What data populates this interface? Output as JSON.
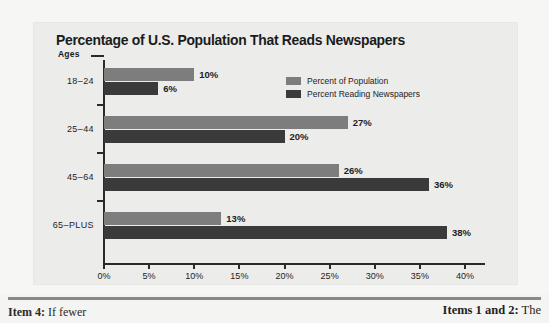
{
  "chart_data": {
    "type": "bar",
    "orientation": "horizontal",
    "title": "Percentage of U.S. Population That Reads Newspapers",
    "xlabel": "",
    "ylabel": "Ages",
    "categories": [
      "18–24",
      "25–44",
      "45–64",
      "65–PLUS"
    ],
    "series": [
      {
        "name": "Percent of Population",
        "color": "#7d7d7d",
        "values": [
          10,
          27,
          26,
          13
        ],
        "labels": [
          "10%",
          "27%",
          "26%",
          "13%"
        ]
      },
      {
        "name": "Percent Reading Newspapers",
        "color": "#3a3a3a",
        "values": [
          6,
          20,
          36,
          38
        ],
        "labels": [
          "6%",
          "20%",
          "36%",
          "38%"
        ]
      }
    ],
    "xlim": [
      0,
      40
    ],
    "xticks": [
      0,
      5,
      10,
      15,
      20,
      25,
      30,
      35,
      40
    ],
    "xtick_labels": [
      "0%",
      "5%",
      "10%",
      "15%",
      "20%",
      "25%",
      "30%",
      "35%",
      "40%"
    ],
    "grid": false,
    "legend_position": "upper-right-inside",
    "value_labels_shown": true
  },
  "axis": {
    "ages_label": "Ages"
  },
  "legend": {
    "items": [
      {
        "label": "Percent of Population",
        "color": "#7d7d7d"
      },
      {
        "label": "Percent Reading Newspapers",
        "color": "#3a3a3a"
      }
    ]
  },
  "footer": {
    "left_bold": "Item 4:",
    "left_rest": " If fewer",
    "right_bold": "Items 1 and 2:",
    "right_rest": " The"
  }
}
